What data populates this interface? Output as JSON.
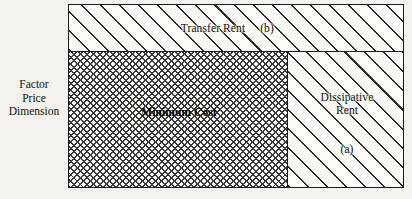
{
  "figure": {
    "axis_caption": {
      "line1": "Factor",
      "line2": "Price",
      "line3": "Dimension"
    },
    "regions": {
      "transfer_rent": {
        "label": "Transfer Rent",
        "tag": "(b)",
        "fill": "diagonal-hatch"
      },
      "minimum_cost": {
        "label": "Minimum Cost",
        "fill": "cross-hatch"
      },
      "dissipative_rent": {
        "label": "Dissipative\nRent",
        "tag": "(a)",
        "fill": "diagonal-hatch"
      }
    },
    "colors": {
      "ink": "#1a1a1a",
      "paper": "#f4f3ef",
      "box_fill": "#fbfaf7",
      "hatch": "#2b2b2b"
    }
  }
}
